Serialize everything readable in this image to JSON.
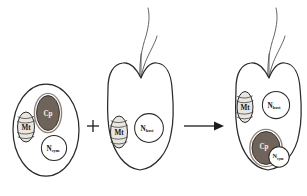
{
  "figure": {
    "background": "#ffffff",
    "width": 307,
    "height": 196
  },
  "colors": {
    "membrane_stroke": "#2b2b2b",
    "chloroplast_fill": "#6e6459",
    "chloroplast_ring": "#8e857a",
    "mitochondrion_fill": "#e9e6e0",
    "nucleus_fill": "#ffffff",
    "flagellum_stroke": "#555555",
    "operator_color": "#1c1c1c",
    "label_dark": "#141414",
    "label_light": "#f3efe9"
  },
  "operators": {
    "plus": "+",
    "arrow": "→"
  },
  "cells": [
    {
      "id": "symbiont-alga",
      "name": "symbiont cell",
      "shape": "oval",
      "has_flagella": false,
      "organelles": [
        {
          "id": "mt-1",
          "kind": "mitochondrion",
          "label": "Mt",
          "subscript": ""
        },
        {
          "id": "cp-1",
          "kind": "chloroplast",
          "label": "Cp",
          "subscript": ""
        },
        {
          "id": "nsym-1",
          "kind": "nucleus",
          "label": "N",
          "subscript": "sym"
        }
      ]
    },
    {
      "id": "host-cell",
      "name": "host cell",
      "shape": "heart",
      "has_flagella": true,
      "flagella_count": 2,
      "organelles": [
        {
          "id": "mt-2",
          "kind": "mitochondrion",
          "label": "Mt",
          "subscript": ""
        },
        {
          "id": "nhost-2",
          "kind": "nucleus",
          "label": "N",
          "subscript": "host"
        }
      ]
    },
    {
      "id": "product-cell",
      "name": "resulting chimeric cell",
      "shape": "heart",
      "has_flagella": true,
      "flagella_count": 2,
      "organelles": [
        {
          "id": "mt-3",
          "kind": "mitochondrion",
          "label": "Mt",
          "subscript": ""
        },
        {
          "id": "nhost-3",
          "kind": "nucleus",
          "label": "N",
          "subscript": "host"
        },
        {
          "id": "cp-3",
          "kind": "chloroplast",
          "label": "Cp",
          "subscript": ""
        },
        {
          "id": "nsym-3",
          "kind": "nucleus",
          "label": "N",
          "subscript": "sym"
        }
      ]
    }
  ]
}
